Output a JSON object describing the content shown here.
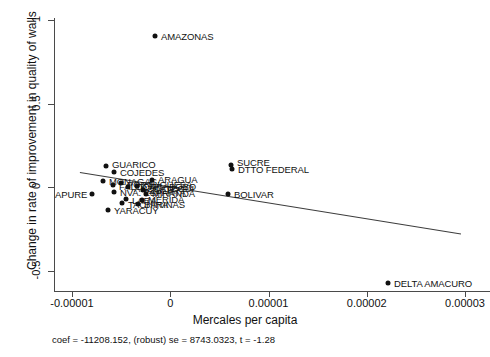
{
  "chart_data": {
    "type": "scatter",
    "title": "",
    "xlabel": "Mercales per capita",
    "ylabel": "Change in rate of improvement in quality of walls",
    "caption": "coef = -11208.152, (robust) se = 8743.0323, t = -1.28",
    "xlim": [
      -1.3e-05,
      3.15e-05
    ],
    "ylim": [
      -0.62,
      1.06
    ],
    "xticks": [
      "-0.00001",
      "0",
      "0.00001",
      "0.00002",
      "0.00003"
    ],
    "xtick_values": [
      -1e-05,
      0,
      1e-05,
      2e-05,
      3e-05
    ],
    "yticks": [
      "1",
      "0.5",
      "0",
      "-0.5"
    ],
    "ytick_values": [
      1,
      0.5,
      0,
      -0.5
    ],
    "grid": false,
    "legend": "none",
    "fit_line": {
      "coef": -11208.152,
      "se": 8743.0323,
      "t": -1.28,
      "x_start": -9.2e-06,
      "y_start": 0.093,
      "x_end": 2.96e-05,
      "y_end": -0.275
    },
    "points": [
      {
        "label": "AMAZONAS",
        "x": 0.0,
        "y": 0.905,
        "px": 155,
        "py": 36,
        "lx": 161,
        "ly": 36
      },
      {
        "label": "GUARICO",
        "x": -5.9e-06,
        "y": 0.132,
        "px": 106,
        "py": 166,
        "lx": 112,
        "ly": 164
      },
      {
        "label": "COJEDES",
        "x": -4.9e-06,
        "y": 0.095,
        "px": 114,
        "py": 172,
        "lx": 120,
        "ly": 172
      },
      {
        "label": "SUCRE",
        "x": 9.1e-06,
        "y": 0.137,
        "px": 231,
        "py": 165,
        "lx": 237,
        "ly": 162
      },
      {
        "label": "DTTO FEDERAL",
        "x": 9.2e-06,
        "y": 0.118,
        "px": 232,
        "py": 169,
        "lx": 238,
        "ly": 169
      },
      {
        "label": "ARAGUA",
        "x": -3e-07,
        "y": 0.052,
        "px": 152,
        "py": 180,
        "lx": 158,
        "ly": 179
      },
      {
        "label": "MONAGAS",
        "x": -6.3e-06,
        "y": 0.049,
        "px": 103,
        "py": 181,
        "lx": 109,
        "ly": 181
      },
      {
        "label": "PORTUGUESA",
        "x": -4.1e-06,
        "y": 0.038,
        "px": 121,
        "py": 183,
        "lx": 127,
        "ly": 184
      },
      {
        "label": "FALCON",
        "x": -5e-06,
        "y": 0.03,
        "px": 113,
        "py": 185,
        "lx": 119,
        "ly": 186
      },
      {
        "label": "CARABOBO",
        "x": -2.1e-06,
        "y": 0.029,
        "px": 137,
        "py": 186,
        "lx": 143,
        "ly": 186
      },
      {
        "label": "ANZOATEGUI",
        "x": -3.2e-06,
        "y": 0.022,
        "px": 128,
        "py": 187,
        "lx": 134,
        "ly": 188
      },
      {
        "label": "NVA. ESPARTA",
        "x": -4.9e-06,
        "y": -0.003,
        "px": 114,
        "py": 192,
        "lx": 120,
        "ly": 192
      },
      {
        "label": "ZULIA",
        "x": -1.4e-06,
        "y": 0.004,
        "px": 143,
        "py": 190,
        "lx": 149,
        "ly": 190
      },
      {
        "label": "APURE",
        "x": -7.3e-06,
        "y": -0.01,
        "px": 92,
        "py": 194,
        "lx": 55,
        "ly": 194
      },
      {
        "label": "MIRANDA",
        "x": -1e-06,
        "y": -0.012,
        "px": 146,
        "py": 194,
        "lx": 152,
        "ly": 193
      },
      {
        "label": "LARA",
        "x": -3.5e-06,
        "y": -0.04,
        "px": 126,
        "py": 199,
        "lx": 132,
        "ly": 200
      },
      {
        "label": "MERIDA",
        "x": -1.5e-06,
        "y": -0.041,
        "px": 142,
        "py": 200,
        "lx": 148,
        "ly": 199
      },
      {
        "label": "TACHIRA",
        "x": -4e-06,
        "y": -0.058,
        "px": 122,
        "py": 203,
        "lx": 128,
        "ly": 204
      },
      {
        "label": "BARINAS",
        "x": -2e-06,
        "y": -0.062,
        "px": 138,
        "py": 204,
        "lx": 144,
        "ly": 204
      },
      {
        "label": "BOLIVAR",
        "x": 8.8e-06,
        "y": -0.01,
        "px": 228,
        "py": 194,
        "lx": 234,
        "ly": 194
      },
      {
        "label": "YARACUY",
        "x": -5.6e-06,
        "y": -0.095,
        "px": 108,
        "py": 210,
        "lx": 114,
        "ly": 210
      },
      {
        "label": "DELTA AMACURO",
        "x": 2.31e-05,
        "y": -0.48,
        "px": 388,
        "py": 283,
        "lx": 394,
        "ly": 283
      }
    ]
  }
}
